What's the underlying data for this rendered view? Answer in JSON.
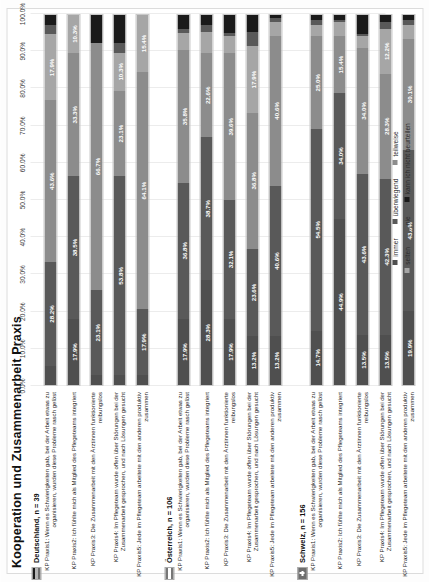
{
  "chart_data": {
    "type": "bar",
    "title": "Kooperation und Zusammenarbeit Praxis",
    "orientation": "horizontal-stacked-100",
    "xlabel": "",
    "ylabel": "",
    "xlim": [
      0,
      100
    ],
    "grid": true,
    "legend_position": "bottom",
    "axis_ticks": [
      "0.0%",
      "10.0%",
      "20.0%",
      "30.0%",
      "40.0%",
      "50.0%",
      "60.0%",
      "70.0%",
      "80.0%",
      "90.0%",
      "100.0%"
    ],
    "axis_tick_values": [
      0,
      10,
      20,
      30,
      40,
      50,
      60,
      70,
      80,
      90,
      100
    ],
    "series": [
      {
        "name": "immer",
        "color": "#4f4f4f"
      },
      {
        "name": "überwiegend",
        "color": "#595959"
      },
      {
        "name": "teilweise",
        "color": "#8c8c8c"
      },
      {
        "name": "selten",
        "color": "#a6a6a6"
      },
      {
        "name": "nie",
        "color": "#595959"
      },
      {
        "name": "kann ich nicht beurteilen",
        "color": "#1a1a1a"
      }
    ],
    "groups": [
      {
        "country": "Deutschland",
        "n_label": "Deutschland,  n = 39",
        "flag": "de",
        "rows": [
          {
            "label": "KP Praxis1: Wenn es Schwierigkeiten gab, bei der Arbeit etwas zu organisieren, wurden diese Probleme rasch gelöst",
            "values": [
              5.1,
              28.2,
              43.6,
              17.9,
              2.6,
              2.6
            ],
            "labels": [
              "",
              "28.2%",
              "43.6%",
              "17.9%",
              "",
              ""
            ]
          },
          {
            "label": "KP Praxis2: Ich fühlte mich als Mitglied des Pflegeteams integriert",
            "values": [
              17.9,
              38.5,
              33.3,
              10.3,
              0.0,
              0.0
            ],
            "labels": [
              "17.9%",
              "38.5%",
              "33.3%",
              "10.3%",
              "",
              ""
            ]
          },
          {
            "label": "KP Praxis3: Die Zusammenarbeit mit den Ärztinnen funktionierte reibungslos",
            "values": [
              2.6,
              23.1,
              66.7,
              0.0,
              0.0,
              7.6
            ],
            "labels": [
              "",
              "23.1%",
              "66.7%",
              "",
              "",
              ""
            ]
          },
          {
            "label": "KP Praxis4: Im Pflegeteam wurde offen über Störungen bei der Zusammenarbeit gesprochen, und nach Lösungen gesucht",
            "values": [
              2.6,
              53.8,
              23.1,
              10.3,
              2.6,
              7.6
            ],
            "labels": [
              "",
              "53.8%",
              "23.1%",
              "10.3%",
              "",
              ""
            ]
          },
          {
            "label": "KP Praxis5: Jede im Pflegeteam arbeitete mit den anderen produktiv zusammen",
            "values": [
              2.6,
              17.9,
              64.1,
              15.4,
              0.0,
              0.0
            ],
            "labels": [
              "",
              "17.9%",
              "64.1%",
              "15.4%",
              "",
              ""
            ]
          }
        ]
      },
      {
        "country": "Österreich",
        "n_label": "Österreich,  n = 106",
        "flag": "at",
        "rows": [
          {
            "label": "KP Praxis1: Wenn es Schwierigkeiten gab, bei der Arbeit etwas zu organisieren, wurden diese Probleme rasch gelöst",
            "values": [
              17.9,
              36.8,
              35.8,
              4.7,
              0.9,
              3.9
            ],
            "labels": [
              "17.9%",
              "36.8%",
              "35.8%",
              "",
              "",
              ""
            ]
          },
          {
            "label": "KP Praxis2: Ich fühlte mich als Mitglied des Pflegeteams integriert",
            "values": [
              28.3,
              38.7,
              22.6,
              5.7,
              1.9,
              2.8
            ],
            "labels": [
              "28.3%",
              "38.7%",
              "22.6%",
              "",
              "",
              ""
            ]
          },
          {
            "label": "KP Praxis3: Die Zusammenarbeit mit den Ärztinnen funktionierte reibungslos",
            "values": [
              17.9,
              32.1,
              39.6,
              4.7,
              0.9,
              4.8
            ],
            "labels": [
              "17.9%",
              "32.1%",
              "39.6%",
              "",
              "",
              ""
            ]
          },
          {
            "label": "KP Praxis4: Im Pflegeteam wurde offen über Störungen bei der Zusammenarbeit gesprochen, und nach Lösungen gesucht",
            "values": [
              13.2,
              23.6,
              36.8,
              17.9,
              3.8,
              4.7
            ],
            "labels": [
              "13.2%",
              "23.6%",
              "36.8%",
              "17.9%",
              "",
              ""
            ]
          },
          {
            "label": "KP Praxis5: Jede im Pflegeteam arbeitete mit den anderen produktiv zusammen",
            "values": [
              13.2,
              40.6,
              40.6,
              3.8,
              0.9,
              0.9
            ],
            "labels": [
              "13.2%",
              "40.6%",
              "40.6%",
              "",
              "",
              ""
            ]
          }
        ]
      },
      {
        "country": "Schweiz",
        "n_label": "Schweiz,  n = 156",
        "flag": "ch",
        "rows": [
          {
            "label": "KP Praxis1: Wenn es Schwierigkeiten gab, bei der Arbeit etwas zu organisieren, wurden diese Probleme rasch gelöst",
            "values": [
              14.7,
              54.5,
              25.0,
              3.2,
              1.3,
              1.3
            ],
            "labels": [
              "14.7%",
              "54.5%",
              "25.0%",
              "",
              "",
              ""
            ]
          },
          {
            "label": "KP Praxis2: Ich fühlte mich als Mitglied des Pflegeteams integriert",
            "values": [
              44.9,
              34.0,
              15.4,
              3.8,
              0.6,
              1.3
            ],
            "labels": [
              "44.9%",
              "34.0%",
              "15.4%",
              "",
              "",
              ""
            ]
          },
          {
            "label": "KP Praxis3: Die Zusammenarbeit mit den Ärztinnen funktionierte reibungslos",
            "values": [
              13.5,
              43.6,
              34.0,
              3.2,
              0.6,
              5.1
            ],
            "labels": [
              "13.5%",
              "43.6%",
              "34.0%",
              "",
              "",
              ""
            ]
          },
          {
            "label": "KP Praxis4: Im Pflegeteam wurde offen über Störungen bei der Zusammenarbeit gesprochen, und nach Lösungen gesucht",
            "values": [
              13.5,
              42.3,
              28.3,
              12.2,
              1.9,
              1.8
            ],
            "labels": [
              "13.5%",
              "42.3%",
              "28.3%",
              "12.2%",
              "",
              ""
            ]
          },
          {
            "label": "KP Praxis5: Jede im Pflegeteam arbeitete mit den anderen produktiv zusammen",
            "values": [
              19.9,
              43.6,
              30.1,
              3.8,
              1.3,
              1.3
            ],
            "labels": [
              "19.9%",
              "43.6%",
              "30.1%",
              "",
              "",
              ""
            ]
          }
        ]
      }
    ]
  }
}
